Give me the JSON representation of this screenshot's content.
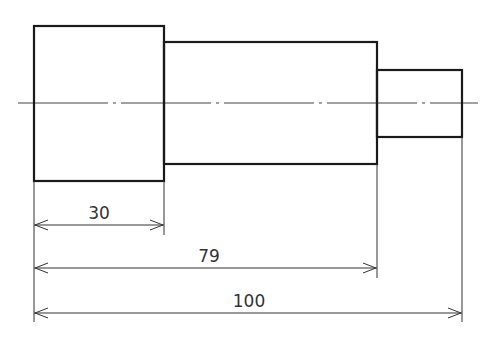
{
  "drawing": {
    "type": "stepped-shaft-side-view",
    "segments": [
      {
        "name": "large-diameter-section",
        "x": 34,
        "y": 26,
        "w": 130,
        "h": 155
      },
      {
        "name": "middle-diameter-section",
        "x": 164,
        "y": 42,
        "w": 213,
        "h": 122
      },
      {
        "name": "small-diameter-section",
        "x": 377,
        "y": 70,
        "w": 85,
        "h": 67
      }
    ],
    "centerline": {
      "y": 103,
      "x1": 18,
      "x2": 478
    }
  },
  "dimensions": [
    {
      "label": "30",
      "x1": 34,
      "x2": 164,
      "y": 225,
      "text_x": 99,
      "text_y": 219
    },
    {
      "label": "79",
      "x1": 34,
      "x2": 377,
      "y": 268,
      "text_x": 209,
      "text_y": 262
    },
    {
      "label": "100",
      "x1": 34,
      "x2": 462,
      "y": 313,
      "text_x": 249,
      "text_y": 307
    }
  ]
}
